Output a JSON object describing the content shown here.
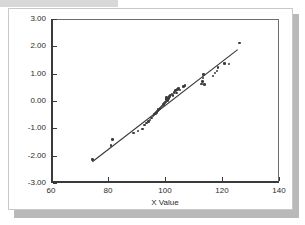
{
  "chart_data": {
    "type": "scatter",
    "title": "",
    "xlabel": "X Value",
    "ylabel": "",
    "xlim": [
      60,
      140
    ],
    "ylim": [
      -3.0,
      3.0
    ],
    "xticks": [
      60,
      80,
      100,
      120,
      140
    ],
    "xtick_labels": [
      "60",
      "80",
      "100",
      "120",
      "140"
    ],
    "yticks": [
      -3.0,
      -2.0,
      -1.0,
      0.0,
      1.0,
      2.0,
      3.0
    ],
    "ytick_labels": [
      "-3.00",
      "-2.00",
      "-1.00",
      "0.00",
      "1.00",
      "2.00",
      "3.00"
    ],
    "grid": false,
    "legend": false,
    "marker_color": "#3b3b3b",
    "line_color": "#3a3a3a",
    "series": [
      {
        "name": "observed",
        "points": [
          [
            74.5,
            -2.15
          ],
          [
            81.0,
            -1.62
          ],
          [
            81.6,
            -1.4
          ],
          [
            89.0,
            -1.17
          ],
          [
            90.5,
            -1.1
          ],
          [
            92.2,
            -1.02
          ],
          [
            92.8,
            -0.88
          ],
          [
            93.5,
            -0.8
          ],
          [
            94.2,
            -0.75
          ],
          [
            94.8,
            -0.7
          ],
          [
            95.3,
            -0.62
          ],
          [
            95.8,
            -0.55
          ],
          [
            96.2,
            -0.5
          ],
          [
            96.6,
            -0.46
          ],
          [
            97.0,
            -0.42
          ],
          [
            97.4,
            -0.36
          ],
          [
            97.8,
            -0.32
          ],
          [
            98.2,
            -0.28
          ],
          [
            98.6,
            -0.22
          ],
          [
            99.0,
            -0.18
          ],
          [
            99.4,
            -0.12
          ],
          [
            99.8,
            -0.08
          ],
          [
            100.1,
            -0.03
          ],
          [
            100.3,
            0.05
          ],
          [
            100.5,
            0.12
          ],
          [
            100.8,
            0.02
          ],
          [
            101.2,
            0.1
          ],
          [
            101.6,
            0.16
          ],
          [
            102.0,
            0.22
          ],
          [
            102.4,
            0.26
          ],
          [
            102.8,
            0.2
          ],
          [
            103.2,
            0.32
          ],
          [
            103.6,
            0.38
          ],
          [
            104.0,
            0.3
          ],
          [
            104.4,
            0.42
          ],
          [
            104.8,
            0.46
          ],
          [
            105.2,
            0.4
          ],
          [
            106.4,
            0.52
          ],
          [
            107.0,
            0.56
          ],
          [
            112.8,
            0.62
          ],
          [
            113.2,
            0.72
          ],
          [
            113.4,
            0.84
          ],
          [
            113.6,
            0.96
          ],
          [
            113.8,
            0.6
          ],
          [
            116.8,
            0.92
          ],
          [
            117.6,
            1.02
          ],
          [
            118.2,
            1.1
          ],
          [
            118.6,
            1.22
          ],
          [
            120.8,
            1.38
          ],
          [
            122.4,
            1.36
          ],
          [
            126.2,
            2.12
          ]
        ]
      }
    ],
    "fit_line": {
      "name": "reference line",
      "x_start": 74.5,
      "y_start": -2.22,
      "x_end": 125.5,
      "y_end": 1.88
    }
  }
}
